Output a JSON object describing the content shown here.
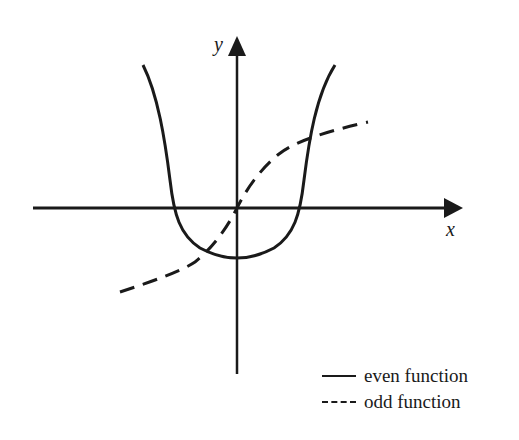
{
  "diagram": {
    "type": "function-graph",
    "axes": {
      "x_label": "x",
      "y_label": "y"
    },
    "curves": [
      {
        "name": "even function",
        "style": "solid"
      },
      {
        "name": "odd function",
        "style": "dashed"
      }
    ],
    "legend": {
      "items": [
        {
          "marker": "solid line",
          "label": "even function"
        },
        {
          "marker": "dashed line",
          "label": "odd function"
        }
      ]
    },
    "colors": {
      "ink": "#1a1a1a",
      "background": "#ffffff"
    }
  }
}
